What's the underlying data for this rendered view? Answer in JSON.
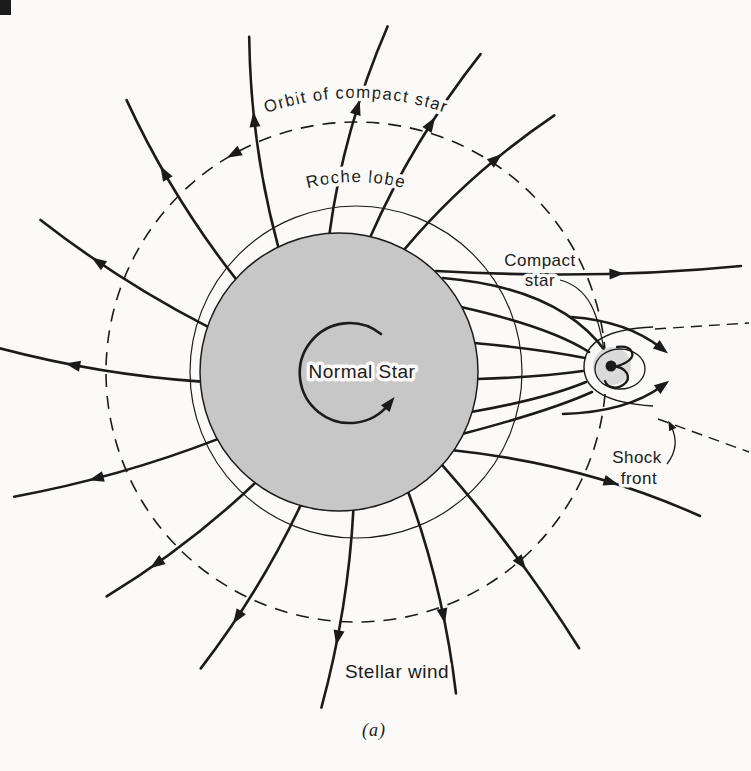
{
  "figure": {
    "labels": {
      "orbit": "Orbit of compact star",
      "roche": "Roche lobe",
      "normal_star": "Normal Star",
      "compact_star_line1": "Compact",
      "compact_star_line2": "star",
      "shock_line1": "Shock",
      "shock_line2": "front",
      "stellar_wind": "Stellar wind"
    },
    "caption": "(a)"
  },
  "colors": {
    "ink": "#1b1b1b",
    "background": "#fbfaf8",
    "star_fill": "#c7c7c7",
    "compact_halo": "#dadada"
  }
}
